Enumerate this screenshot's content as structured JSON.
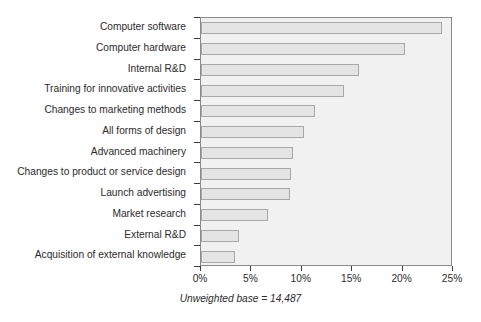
{
  "chart_data": {
    "type": "bar",
    "orientation": "horizontal",
    "title": "",
    "subtitle": "",
    "xlabel": "",
    "ylabel": "",
    "xlim": [
      0,
      25
    ],
    "xticks": [
      0,
      5,
      10,
      15,
      20,
      25
    ],
    "xtick_labels": [
      "0%",
      "5%",
      "10%",
      "15%",
      "20%",
      "25%"
    ],
    "grid": false,
    "legend": false,
    "categories": [
      "Computer software",
      "Computer hardware",
      "Internal R&D",
      "Training for innovative activities",
      "Changes to marketing methods",
      "All forms of design",
      "Advanced machinery",
      "Changes to product or service design",
      "Launch advertising",
      "Market research",
      "External R&D",
      "Acquisition of external knowledge"
    ],
    "values": [
      23.9,
      20.2,
      15.7,
      14.2,
      11.3,
      10.2,
      9.1,
      8.9,
      8.8,
      6.6,
      3.8,
      3.4
    ],
    "annotations": [
      "Unweighted base = 14,487"
    ],
    "colors": {
      "bar_fill": "#e4e4e4",
      "bar_border": "#a8a8a8",
      "plot_background": "#f1f1f1",
      "plot_border": "#8a8a8a",
      "text": "#2b2b2b"
    }
  },
  "footnote": "Unweighted base = 14,487"
}
